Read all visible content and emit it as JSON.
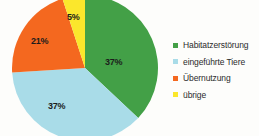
{
  "chart_data": {
    "type": "pie",
    "title": "",
    "subtitle": "",
    "xlabel": "",
    "ylabel": "",
    "grid": false,
    "legend_position": "right",
    "start_angle_deg": 0,
    "direction": "clockwise",
    "categories": [
      "Habitatzerstörung",
      "eingeführte Tiere",
      "Übernutzung",
      "übrige"
    ],
    "values": [
      37,
      37,
      21,
      5
    ],
    "unit": "%",
    "data_labels": [
      "37%",
      "37%",
      "21%",
      "5%"
    ],
    "colors": [
      "#43a047",
      "#a9dce8",
      "#f4681f",
      "#fbe72c"
    ],
    "slices": [
      {
        "label": "Habitatzerstörung",
        "value": 37,
        "data_label": "37%",
        "color": "#43a047"
      },
      {
        "label": "eingeführte Tiere",
        "value": 37,
        "data_label": "37%",
        "color": "#a9dce8"
      },
      {
        "label": "Übernutzung",
        "value": 21,
        "data_label": "21%",
        "color": "#f4681f"
      },
      {
        "label": "übrige",
        "value": 5,
        "data_label": "5%",
        "color": "#fbe72c"
      }
    ]
  },
  "legend": {
    "items": [
      {
        "label": "Habitatzerstörung",
        "color": "#43a047"
      },
      {
        "label": "eingeführte Tiere",
        "color": "#a9dce8"
      },
      {
        "label": "Übernutzung",
        "color": "#f4681f"
      },
      {
        "label": "übrige",
        "color": "#fbe72c"
      }
    ]
  },
  "background_color": "#fdfdfb"
}
